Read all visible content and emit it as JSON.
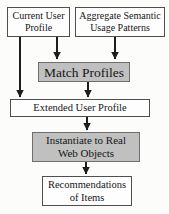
{
  "diagram": {
    "nodes": {
      "current_user_profile": {
        "label": "Current User\nProfile",
        "style": "plain"
      },
      "aggregate_semantic_usage_patterns": {
        "label": "Aggregate Semantic\nUsage Patterns",
        "style": "plain"
      },
      "match_profiles": {
        "label": "Match Profiles",
        "style": "highlight"
      },
      "extended_user_profile": {
        "label": "Extended User Profile",
        "style": "plain"
      },
      "instantiate_to_real_web_objects": {
        "label": "Instantiate to Real\nWeb Objects",
        "style": "highlight"
      },
      "recommendations_of_items": {
        "label": "Recommendations\nof Items",
        "style": "plain"
      }
    },
    "edges": [
      {
        "from": "current_user_profile",
        "to": "extended_user_profile"
      },
      {
        "from": "current_user_profile",
        "to": "match_profiles"
      },
      {
        "from": "aggregate_semantic_usage_patterns",
        "to": "match_profiles"
      },
      {
        "from": "match_profiles",
        "to": "extended_user_profile"
      },
      {
        "from": "extended_user_profile",
        "to": "instantiate_to_real_web_objects"
      },
      {
        "from": "instantiate_to_real_web_objects",
        "to": "recommendations_of_items"
      }
    ],
    "colors": {
      "background": "#fcfcfa",
      "box_fill": "#fefefe",
      "box_fill_highlight": "#c0c0c0",
      "box_border": "#4f4f4f",
      "arrow": "#1d1d1d",
      "text": "#161616"
    }
  }
}
